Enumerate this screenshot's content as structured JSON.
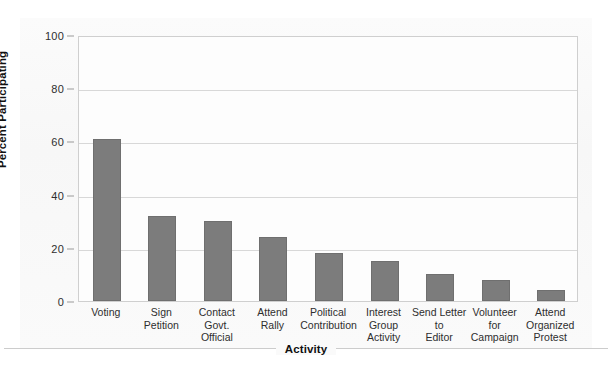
{
  "chart_data": {
    "type": "bar",
    "title": "",
    "subtitle": "",
    "xlabel": "Activity",
    "ylabel": "Percent Participating",
    "categories": [
      "Voting",
      "Sign Petition",
      "Contact\nGovt.\nOfficial",
      "Attend Rally",
      "Political\nContribution",
      "Interest\nGroup\nActivity",
      "Send Letter\nto\nEditor",
      "Volunteer\nfor\nCampaign",
      "Attend\nOrganized\nProtest"
    ],
    "values": [
      61,
      32,
      30,
      24,
      18,
      15,
      10,
      8,
      4
    ],
    "ylim": [
      0,
      100
    ],
    "yticks": [
      0,
      20,
      40,
      60,
      80,
      100
    ],
    "ytick_labels": [
      "0",
      "20",
      "40",
      "60",
      "80",
      "100"
    ],
    "grid": true,
    "legend": false,
    "legend_position": "none",
    "bar_color": "#7c7c7c",
    "bar_border_color": "#6f6f6f",
    "gridline_color": "#d8d8d8",
    "plot_border_color": "#cfcfcf",
    "background_color": "#ffffff",
    "text_color": "#2e2e2e"
  }
}
